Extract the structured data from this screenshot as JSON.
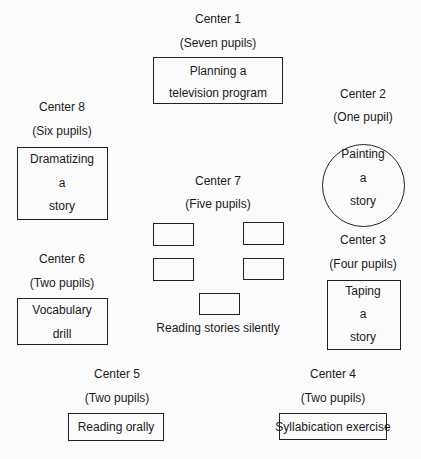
{
  "centers": [
    {
      "name": "Center 1",
      "pupils": "(Seven pupils)",
      "activity_lines": [
        "Planning a",
        "television program"
      ],
      "shape": "rectangle"
    },
    {
      "name": "Center 2",
      "pupils": "(One pupil)",
      "activity_lines": [
        "Painting",
        "a",
        "story"
      ],
      "shape": "circle"
    },
    {
      "name": "Center 3",
      "pupils": "(Four pupils)",
      "activity_lines": [
        "Taping",
        "a",
        "story"
      ],
      "shape": "rectangle"
    },
    {
      "name": "Center 4",
      "pupils": "(Two pupils)",
      "activity_lines": [
        "Syllabication exercise"
      ],
      "shape": "rectangle"
    },
    {
      "name": "Center 5",
      "pupils": "(Two pupils)",
      "activity_lines": [
        "Reading orally"
      ],
      "shape": "rectangle"
    },
    {
      "name": "Center 6",
      "pupils": "(Two pupils)",
      "activity_lines": [
        "Vocabulary",
        "drill"
      ],
      "shape": "rectangle"
    },
    {
      "name": "Center 7",
      "pupils": "(Five pupils)",
      "activity_lines": [
        "Reading stories silently"
      ],
      "shape": "five-desks"
    },
    {
      "name": "Center 8",
      "pupils": "(Six pupils)",
      "activity_lines": [
        "Dramatizing",
        "a",
        "story"
      ],
      "shape": "rectangle"
    }
  ]
}
